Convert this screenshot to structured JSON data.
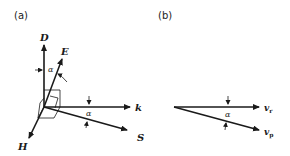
{
  "panels": [
    {
      "id": "a",
      "label": "(a)",
      "vectors": {
        "D": "D",
        "E": "E",
        "k": "k",
        "S": "S",
        "H": "H"
      },
      "angle_labels": [
        "α",
        "α"
      ]
    },
    {
      "id": "b",
      "label": "(b)",
      "vectors": {
        "vr": "v",
        "vr_sub": "r",
        "vp": "v",
        "vp_sub": "p"
      },
      "angle_label": "α"
    }
  ],
  "colors": {
    "stroke": "#1a1a1a",
    "background": "#ffffff"
  }
}
